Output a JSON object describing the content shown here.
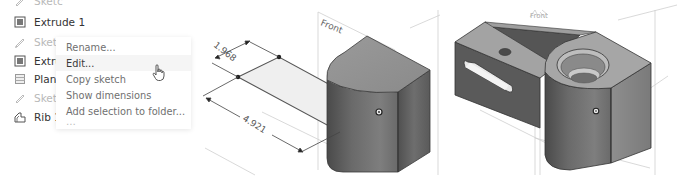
{
  "feature_tree": {
    "items": [
      {
        "label": "Sketch 3",
        "icon": "sketch-icon",
        "state": "dimmed-clipped"
      },
      {
        "label": "Extrude 1",
        "icon": "extrude-icon",
        "state": "normal"
      },
      {
        "label": "Sketch 2",
        "icon": "sketch-icon",
        "state": "dimmed"
      },
      {
        "label": "Extrude 2",
        "icon": "extrude-icon",
        "state": "normal"
      },
      {
        "label": "Plane 1",
        "icon": "plane-icon",
        "state": "normal"
      },
      {
        "label": "Sketch 4",
        "icon": "sketch-icon",
        "state": "dimmed"
      },
      {
        "label": "Rib 1",
        "icon": "rib-icon",
        "state": "normal"
      }
    ],
    "visible_truncated": [
      "Sketc",
      "Extrude 1",
      "Sketc",
      "Extru",
      "Plan",
      "Sketc",
      "Rib 1"
    ]
  },
  "context_menu": {
    "items": [
      {
        "label": "Rename...",
        "hovered": false
      },
      {
        "label": "Edit...",
        "hovered": true
      },
      {
        "label": "Copy sketch",
        "hovered": false
      },
      {
        "label": "Show dimensions",
        "hovered": false
      },
      {
        "label": "Add selection to folder...",
        "hovered": false
      },
      {
        "label": "…",
        "hovered": false
      }
    ]
  },
  "cursor": {
    "icon": "hand-pointer-icon"
  },
  "viewport": {
    "left_view": {
      "plane_label": "Front",
      "dimensions": [
        "1.968",
        "4.921"
      ]
    },
    "right_view": {
      "plane_label": "Front"
    }
  },
  "colors": {
    "text_primary": "#333333",
    "text_dimmed": "#b8b8b8",
    "menu_text": "#707070",
    "part_dark": "#5a5a5a",
    "part_light": "#9a9a9a",
    "sketch_fill": "#eeeeee"
  }
}
